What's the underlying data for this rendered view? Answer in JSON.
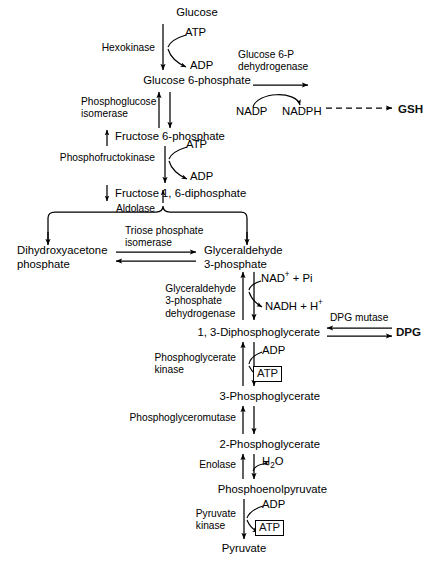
{
  "diagram": {
    "type": "metabolic-pathway-diagram",
    "metabolites": [
      {
        "id": "glucose",
        "label": "Glucose",
        "x": 197,
        "y": 12
      },
      {
        "id": "glucose-6-phosphate",
        "label": "Glucose 6-phosphate",
        "x": 197,
        "y": 80
      },
      {
        "id": "fructose-6-phosphate",
        "label": "Fructose 6-phosphate",
        "x": 204,
        "y": 136
      },
      {
        "id": "fructose-1-6-diphosphate",
        "label": "Fructose 1, 6-diphosphate",
        "x": 208,
        "y": 193
      },
      {
        "id": "dihydroxyacetone-phosphate",
        "label": "Dihydroxyacetone",
        "label2": "phosphate",
        "x": 17,
        "y": 248
      },
      {
        "id": "glyceraldehyde-3-phosphate",
        "label": "Glyceraldehyde",
        "label2": "3-phosphate",
        "x": 204,
        "y": 248
      },
      {
        "id": "1-3-diphosphoglycerate",
        "label": "1, 3-Diphosphoglycerate",
        "x": 244,
        "y": 332
      },
      {
        "id": "3-phosphoglycerate",
        "label": "3-Phosphoglycerate",
        "x": 244,
        "y": 396
      },
      {
        "id": "2-phosphoglycerate",
        "label": "2-Phosphoglycerate",
        "x": 244,
        "y": 444
      },
      {
        "id": "phosphoenolpyruvate",
        "label": "Phosphoenolpyruvate",
        "x": 244,
        "y": 489
      },
      {
        "id": "pyruvate",
        "label": "Pyruvate",
        "x": 244,
        "y": 548
      },
      {
        "id": "gsh",
        "label": "GSH",
        "x": 400,
        "y": 109
      },
      {
        "id": "dpg",
        "label": "DPG",
        "x": 398,
        "y": 331
      }
    ],
    "enzymes": [
      {
        "id": "hexokinase",
        "label": "Hexokinase",
        "x": 155,
        "y": 46
      },
      {
        "id": "glucose-6-p-dehydrogenase",
        "label": "Glucose 6-P",
        "label2": "dehydrogenase",
        "x": 238,
        "y": 55
      },
      {
        "id": "phosphoglucose-isomerase",
        "label": "Phosphoglucose",
        "label2": "isomerase",
        "x": 161,
        "y": 102
      },
      {
        "id": "phosphofructokinase",
        "label": "Phosphofructokinase",
        "x": 161,
        "y": 157
      },
      {
        "id": "aldolase",
        "label": "Aldolase",
        "x": 196,
        "y": 208
      },
      {
        "id": "triose-phosphate-isomerase",
        "label": "Triose phosphate",
        "label2": "isomerase",
        "x": 125,
        "y": 230
      },
      {
        "id": "glyceraldehyde-3-phosphate-dehydrogenase",
        "label": "Glyceraldehyde",
        "label2": "3-phosphate",
        "label3": "dehydrogenase",
        "x": 232,
        "y": 287
      },
      {
        "id": "dpg-mutase",
        "label": "DPG mutase",
        "x": 330,
        "y": 318
      },
      {
        "id": "phosphoglycerate-kinase",
        "label": "Phosphoglycerate",
        "label2": "kinase",
        "x": 239,
        "y": 357
      },
      {
        "id": "phosphoglyceromutase",
        "label": "Phosphoglyceromutase",
        "x": 239,
        "y": 417
      },
      {
        "id": "enolase",
        "label": "Enolase",
        "x": 239,
        "y": 464
      },
      {
        "id": "pyruvate-kinase",
        "label": "Pyruvate",
        "label2": "kinase",
        "x": 239,
        "y": 513
      }
    ],
    "cofactors": [
      {
        "id": "atp-hexokinase",
        "label": "ATP",
        "x": 185,
        "y": 31
      },
      {
        "id": "adp-hexokinase",
        "label": "ADP",
        "x": 190,
        "y": 64
      },
      {
        "id": "nadp",
        "label": "NADP",
        "x": 240,
        "y": 111
      },
      {
        "id": "nadph",
        "label": "NADPH",
        "x": 282,
        "y": 111
      },
      {
        "id": "atp-pfk",
        "label": "ATP",
        "x": 186,
        "y": 143
      },
      {
        "id": "adp-pfk",
        "label": "ADP",
        "x": 190,
        "y": 175
      },
      {
        "id": "nad-pi",
        "label": "NAD+ + Pi",
        "html": "NAD<sup>+</sup> + Pi",
        "x": 261,
        "y": 277
      },
      {
        "id": "nadh-h",
        "label": "NADH + H+",
        "html": "NADH + H<sup>+</sup>",
        "x": 265,
        "y": 305
      },
      {
        "id": "adp-pgk",
        "label": "ADP",
        "x": 262,
        "y": 349
      },
      {
        "id": "atp-pgk",
        "label": "ATP",
        "x": 254,
        "y": 372
      },
      {
        "id": "h2o",
        "label": "H2O",
        "html": "H<sub>2</sub>O",
        "x": 262,
        "y": 460
      },
      {
        "id": "adp-pk",
        "label": "ADP",
        "x": 262,
        "y": 503
      },
      {
        "id": "atp-pk",
        "label": "ATP",
        "x": 256,
        "y": 526
      }
    ],
    "colors": {
      "stroke": "#000000",
      "background": "#ffffff",
      "text": "#111111"
    }
  }
}
